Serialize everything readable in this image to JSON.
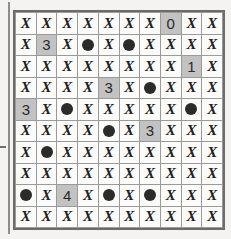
{
  "puzzle": {
    "type": "minesweeper-grid",
    "rows": 10,
    "cols": 10,
    "symbols": {
      "x_glyph": "X",
      "mine_glyph": "mine-dot"
    },
    "colors": {
      "page_background": "#f4f3f1",
      "cell_background": "#fbfbfa",
      "clue_cell_background": "#c2c2c2",
      "grid_line": "#9a9a9a",
      "grid_border": "#6b6b6b",
      "mark_color": "#212121",
      "mine_color": "#2b2b2b"
    },
    "cells": [
      [
        {
          "kind": "x",
          "label": "X",
          "shaded": false
        },
        {
          "kind": "x",
          "label": "X",
          "shaded": false
        },
        {
          "kind": "x",
          "label": "X",
          "shaded": false
        },
        {
          "kind": "x",
          "label": "X",
          "shaded": false
        },
        {
          "kind": "x",
          "label": "X",
          "shaded": false
        },
        {
          "kind": "x",
          "label": "X",
          "shaded": false
        },
        {
          "kind": "x",
          "label": "X",
          "shaded": false
        },
        {
          "kind": "number",
          "label": "0",
          "shaded": true
        },
        {
          "kind": "x",
          "label": "X",
          "shaded": false
        },
        {
          "kind": "x",
          "label": "X",
          "shaded": false
        }
      ],
      [
        {
          "kind": "x",
          "label": "X",
          "shaded": false
        },
        {
          "kind": "number",
          "label": "3",
          "shaded": true
        },
        {
          "kind": "x",
          "label": "X",
          "shaded": false
        },
        {
          "kind": "mine",
          "label": "",
          "shaded": false
        },
        {
          "kind": "x",
          "label": "X",
          "shaded": false
        },
        {
          "kind": "mine",
          "label": "",
          "shaded": false
        },
        {
          "kind": "x",
          "label": "X",
          "shaded": false
        },
        {
          "kind": "x",
          "label": "X",
          "shaded": false
        },
        {
          "kind": "x",
          "label": "X",
          "shaded": false
        },
        {
          "kind": "x",
          "label": "X",
          "shaded": false
        }
      ],
      [
        {
          "kind": "x",
          "label": "X",
          "shaded": false
        },
        {
          "kind": "x",
          "label": "X",
          "shaded": false
        },
        {
          "kind": "x",
          "label": "X",
          "shaded": false
        },
        {
          "kind": "x",
          "label": "X",
          "shaded": false
        },
        {
          "kind": "x",
          "label": "X",
          "shaded": false
        },
        {
          "kind": "x",
          "label": "X",
          "shaded": false
        },
        {
          "kind": "x",
          "label": "X",
          "shaded": false
        },
        {
          "kind": "x",
          "label": "X",
          "shaded": false
        },
        {
          "kind": "number",
          "label": "1",
          "shaded": true
        },
        {
          "kind": "x",
          "label": "X",
          "shaded": false
        }
      ],
      [
        {
          "kind": "x",
          "label": "X",
          "shaded": false
        },
        {
          "kind": "x",
          "label": "X",
          "shaded": false
        },
        {
          "kind": "x",
          "label": "X",
          "shaded": false
        },
        {
          "kind": "x",
          "label": "X",
          "shaded": false
        },
        {
          "kind": "number",
          "label": "3",
          "shaded": true
        },
        {
          "kind": "x",
          "label": "X",
          "shaded": false
        },
        {
          "kind": "mine",
          "label": "",
          "shaded": false
        },
        {
          "kind": "x",
          "label": "X",
          "shaded": false
        },
        {
          "kind": "x",
          "label": "X",
          "shaded": false
        },
        {
          "kind": "x",
          "label": "X",
          "shaded": false
        }
      ],
      [
        {
          "kind": "number",
          "label": "3",
          "shaded": true
        },
        {
          "kind": "x",
          "label": "X",
          "shaded": false
        },
        {
          "kind": "mine",
          "label": "",
          "shaded": false
        },
        {
          "kind": "x",
          "label": "X",
          "shaded": false
        },
        {
          "kind": "x",
          "label": "X",
          "shaded": false
        },
        {
          "kind": "x",
          "label": "X",
          "shaded": false
        },
        {
          "kind": "x",
          "label": "X",
          "shaded": false
        },
        {
          "kind": "x",
          "label": "X",
          "shaded": false
        },
        {
          "kind": "mine",
          "label": "",
          "shaded": false
        },
        {
          "kind": "x",
          "label": "X",
          "shaded": false
        }
      ],
      [
        {
          "kind": "x",
          "label": "X",
          "shaded": false
        },
        {
          "kind": "x",
          "label": "X",
          "shaded": false
        },
        {
          "kind": "x",
          "label": "X",
          "shaded": false
        },
        {
          "kind": "x",
          "label": "X",
          "shaded": false
        },
        {
          "kind": "mine",
          "label": "",
          "shaded": false
        },
        {
          "kind": "x",
          "label": "X",
          "shaded": false
        },
        {
          "kind": "number",
          "label": "3",
          "shaded": true
        },
        {
          "kind": "x",
          "label": "X",
          "shaded": false
        },
        {
          "kind": "x",
          "label": "X",
          "shaded": false
        },
        {
          "kind": "x",
          "label": "X",
          "shaded": false
        }
      ],
      [
        {
          "kind": "x",
          "label": "X",
          "shaded": false
        },
        {
          "kind": "mine",
          "label": "",
          "shaded": false
        },
        {
          "kind": "x",
          "label": "X",
          "shaded": false
        },
        {
          "kind": "x",
          "label": "X",
          "shaded": false
        },
        {
          "kind": "x",
          "label": "X",
          "shaded": false
        },
        {
          "kind": "x",
          "label": "X",
          "shaded": false
        },
        {
          "kind": "x",
          "label": "X",
          "shaded": false
        },
        {
          "kind": "x",
          "label": "X",
          "shaded": false
        },
        {
          "kind": "x",
          "label": "X",
          "shaded": false
        },
        {
          "kind": "x",
          "label": "X",
          "shaded": false
        }
      ],
      [
        {
          "kind": "x",
          "label": "X",
          "shaded": false
        },
        {
          "kind": "x",
          "label": "X",
          "shaded": false
        },
        {
          "kind": "x",
          "label": "X",
          "shaded": false
        },
        {
          "kind": "x",
          "label": "X",
          "shaded": false
        },
        {
          "kind": "x",
          "label": "X",
          "shaded": false
        },
        {
          "kind": "x",
          "label": "X",
          "shaded": false
        },
        {
          "kind": "x",
          "label": "X",
          "shaded": false
        },
        {
          "kind": "x",
          "label": "X",
          "shaded": false
        },
        {
          "kind": "x",
          "label": "X",
          "shaded": false
        },
        {
          "kind": "x",
          "label": "X",
          "shaded": false
        }
      ],
      [
        {
          "kind": "mine",
          "label": "",
          "shaded": false
        },
        {
          "kind": "x",
          "label": "X",
          "shaded": false
        },
        {
          "kind": "number",
          "label": "4",
          "shaded": true
        },
        {
          "kind": "x",
          "label": "X",
          "shaded": false
        },
        {
          "kind": "mine",
          "label": "",
          "shaded": false
        },
        {
          "kind": "x",
          "label": "X",
          "shaded": false
        },
        {
          "kind": "mine",
          "label": "",
          "shaded": false
        },
        {
          "kind": "x",
          "label": "X",
          "shaded": false
        },
        {
          "kind": "x",
          "label": "X",
          "shaded": false
        },
        {
          "kind": "x",
          "label": "X",
          "shaded": false
        }
      ],
      [
        {
          "kind": "x",
          "label": "X",
          "shaded": false
        },
        {
          "kind": "x",
          "label": "X",
          "shaded": false
        },
        {
          "kind": "x",
          "label": "X",
          "shaded": false
        },
        {
          "kind": "x",
          "label": "X",
          "shaded": false
        },
        {
          "kind": "x",
          "label": "X",
          "shaded": false
        },
        {
          "kind": "x",
          "label": "X",
          "shaded": false
        },
        {
          "kind": "x",
          "label": "X",
          "shaded": false
        },
        {
          "kind": "x",
          "label": "X",
          "shaded": false
        },
        {
          "kind": "x",
          "label": "X",
          "shaded": false
        },
        {
          "kind": "x",
          "label": "X",
          "shaded": false
        }
      ]
    ]
  }
}
